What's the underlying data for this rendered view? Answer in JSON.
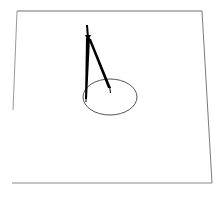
{
  "scene": {
    "subject": "drafting compass drawing a circle on a sheet of paper",
    "colors": {
      "background": "#ffffff",
      "paper_edge": "#6f6f6f",
      "compass": "#000000",
      "circle": "#555555"
    }
  },
  "icons": {
    "compass": "compass-icon",
    "circle": "circle-shape",
    "paper": "paper-sheet"
  }
}
